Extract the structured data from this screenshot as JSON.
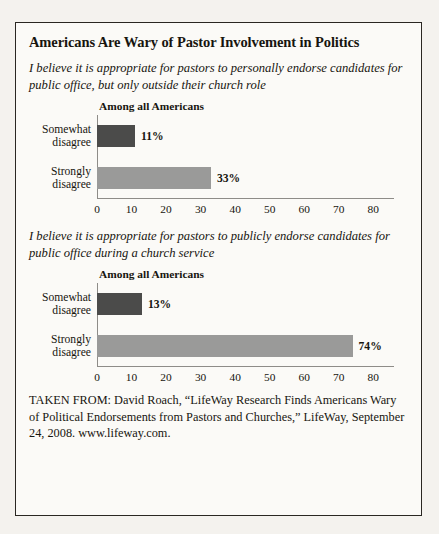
{
  "figure": {
    "title": "Americans Are Wary of Pastor Involvement in Politics",
    "source": "TAKEN FROM: David Roach, “LifeWay Research Finds Americans Wary of Political Endorsements from Pastors and Churches,” LifeWay, September 24, 2008. www.lifeway.com."
  },
  "colors": {
    "bar_dark": "#4b4b4a",
    "bar_light": "#9a9a99",
    "border": "#2a2722",
    "axis": "#8e8c88"
  },
  "chart_data": [
    {
      "type": "bar",
      "orientation": "horizontal",
      "title": "I believe it is appropriate for pastors to personally endorse candidates for public office, but only outside their church role",
      "series_label": "Among all Americans",
      "categories": [
        "Somewhat\ndisagree",
        "Strongly\ndisagree"
      ],
      "values": [
        11,
        33
      ],
      "value_labels": [
        "11%",
        "33%"
      ],
      "bar_colors": [
        "#4b4b4a",
        "#9a9a99"
      ],
      "xlabel": "",
      "ylabel": "",
      "xlim": [
        0,
        86
      ],
      "xticks": [
        0,
        10,
        20,
        30,
        40,
        50,
        60,
        70,
        80
      ],
      "xtick_labels": [
        "0",
        "10",
        "20",
        "30",
        "40",
        "50",
        "60",
        "70",
        "80"
      ],
      "grid": false,
      "legend": false
    },
    {
      "type": "bar",
      "orientation": "horizontal",
      "title": "I believe it is appropriate for pastors to publicly endorse candidates for public office during a church service",
      "series_label": "Among all Americans",
      "categories": [
        "Somewhat\ndisagree",
        "Strongly\ndisagree"
      ],
      "values": [
        13,
        74
      ],
      "value_labels": [
        "13%",
        "74%"
      ],
      "bar_colors": [
        "#4b4b4a",
        "#9a9a99"
      ],
      "xlabel": "",
      "ylabel": "",
      "xlim": [
        0,
        86
      ],
      "xticks": [
        0,
        10,
        20,
        30,
        40,
        50,
        60,
        70,
        80
      ],
      "xtick_labels": [
        "0",
        "10",
        "20",
        "30",
        "40",
        "50",
        "60",
        "70",
        "80"
      ],
      "grid": false,
      "legend": false
    }
  ]
}
